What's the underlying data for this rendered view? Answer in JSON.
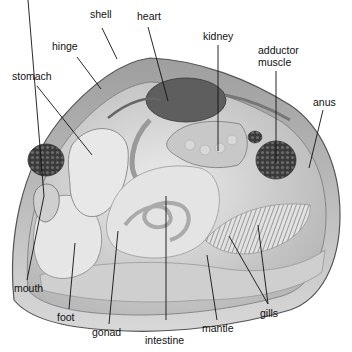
{
  "labels": {
    "shell": "shell",
    "heart": "heart",
    "hinge": "hinge",
    "kidney": "kidney",
    "adductor_muscle_line1": "adductor",
    "adductor_muscle_line2": "muscle",
    "stomach": "stomach",
    "anus": "anus",
    "mouth": "mouth",
    "foot": "foot",
    "gonad": "gonad",
    "intestine": "intestine",
    "mantle": "mantle",
    "gills": "gills"
  },
  "colors": {
    "background": "#ffffff",
    "shell_outer": "#bdbdbd",
    "body_fill": "#d6d6d6",
    "dark_organ": "#5e5e5e",
    "leader_line": "#111111"
  }
}
